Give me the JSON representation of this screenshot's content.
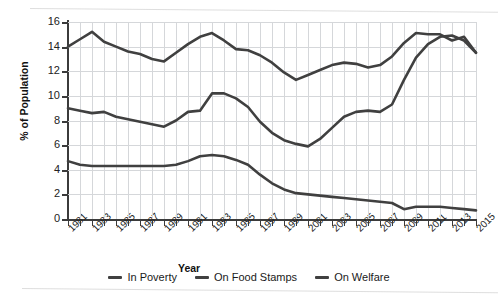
{
  "chart_data": {
    "type": "line",
    "title": "",
    "xlabel": "Year",
    "ylabel": "% of Population",
    "ylim": [
      0,
      16
    ],
    "yticks": [
      0,
      2,
      4,
      6,
      8,
      10,
      12,
      14,
      16
    ],
    "xlim": [
      1981,
      2015
    ],
    "x": [
      1981,
      1982,
      1983,
      1984,
      1985,
      1986,
      1987,
      1988,
      1989,
      1990,
      1991,
      1992,
      1993,
      1994,
      1995,
      1996,
      1997,
      1998,
      1999,
      2000,
      2001,
      2002,
      2003,
      2004,
      2005,
      2006,
      2007,
      2008,
      2009,
      2010,
      2011,
      2012,
      2013,
      2014,
      2015
    ],
    "xtick_labels": [
      "1981",
      "1983",
      "1985",
      "1987",
      "1989",
      "1991",
      "1993",
      "1995",
      "1997",
      "1999",
      "2001",
      "2003",
      "2005",
      "2007",
      "2009",
      "2011",
      "2013",
      "2015"
    ],
    "grid": true,
    "legend_position": "bottom",
    "series": [
      {
        "name": "In Poverty",
        "color": "#404040",
        "values": [
          14.0,
          14.6,
          15.2,
          14.4,
          14.0,
          13.6,
          13.4,
          13.0,
          12.8,
          13.5,
          14.2,
          14.8,
          15.1,
          14.5,
          13.8,
          13.7,
          13.3,
          12.7,
          11.9,
          11.3,
          11.7,
          12.1,
          12.5,
          12.7,
          12.6,
          12.3,
          12.5,
          13.2,
          14.3,
          15.1,
          15.0,
          15.0,
          14.5,
          14.8,
          13.5
        ],
        "marker": "none"
      },
      {
        "name": "On Food Stamps",
        "color": "#404040",
        "values": [
          9.0,
          8.8,
          8.6,
          8.7,
          8.3,
          8.1,
          7.9,
          7.7,
          7.5,
          8.0,
          8.7,
          8.8,
          10.2,
          10.2,
          9.8,
          9.1,
          7.9,
          7.0,
          6.4,
          6.1,
          5.9,
          6.5,
          7.4,
          8.3,
          8.7,
          8.8,
          8.7,
          9.3,
          11.3,
          13.1,
          14.2,
          14.8,
          14.9,
          14.5,
          13.5
        ],
        "marker": "none"
      },
      {
        "name": "On Welfare",
        "color": "#404040",
        "values": [
          4.7,
          4.4,
          4.3,
          4.3,
          4.3,
          4.3,
          4.3,
          4.3,
          4.3,
          4.4,
          4.7,
          5.1,
          5.2,
          5.1,
          4.8,
          4.4,
          3.6,
          2.9,
          2.4,
          2.1,
          2.0,
          1.9,
          1.8,
          1.7,
          1.6,
          1.5,
          1.4,
          1.3,
          0.8,
          1.0,
          1.0,
          1.0,
          0.9,
          0.8,
          0.7
        ],
        "marker": "none"
      }
    ]
  },
  "legend": {
    "items": [
      {
        "label": "In Poverty"
      },
      {
        "label": "On Food Stamps"
      },
      {
        "label": "On Welfare"
      }
    ]
  },
  "axes": {
    "y_title": "% of Population",
    "x_title": "Year"
  }
}
